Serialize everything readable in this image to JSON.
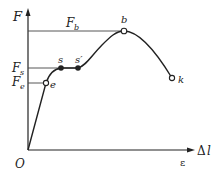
{
  "diagram": {
    "axes": {
      "y_label": "F",
      "x_label_main": "Δ",
      "x_label_var": "l",
      "x_label_secondary": "ε",
      "origin_label": "O"
    },
    "levels": {
      "Fb": {
        "letter": "F",
        "sub": "b"
      },
      "Fs": {
        "letter": "F",
        "sub": "s"
      },
      "Fe": {
        "letter": "F",
        "sub": "e"
      }
    },
    "points": {
      "e": {
        "label": "e",
        "style": "open"
      },
      "s": {
        "label": "s",
        "style": "filled"
      },
      "s_prime": {
        "label": "s′",
        "style": "filled"
      },
      "b": {
        "label": "b",
        "style": "open"
      },
      "k": {
        "label": "k",
        "style": "open"
      }
    },
    "colors": {
      "line": "#222222",
      "guide": "#444444",
      "background": "#ffffff"
    }
  }
}
